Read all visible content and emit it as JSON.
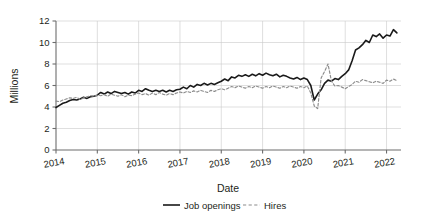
{
  "chart_data": {
    "type": "line",
    "title": "",
    "xlabel": "Date",
    "ylabel": "Millions",
    "xlim": [
      2014.0,
      2022.35
    ],
    "ylim": [
      0,
      12
    ],
    "yticks": [
      0,
      2,
      4,
      6,
      8,
      10,
      12
    ],
    "ytick_labels": [
      "0",
      "2",
      "4",
      "6",
      "8",
      "10",
      "12"
    ],
    "xticks": [
      2014,
      2015,
      2016,
      2017,
      2018,
      2019,
      2020,
      2021,
      2022
    ],
    "xtick_labels": [
      "2014",
      "2015",
      "2016",
      "2017",
      "2018",
      "2019",
      "2020",
      "2021",
      "2022"
    ],
    "grid": true,
    "grid_color": "#c9c9c9",
    "legend_position": "bottom",
    "legend": [
      {
        "name": "Job openings",
        "style": "solid",
        "color": "#1a1a1a"
      },
      {
        "name": "Hires",
        "style": "dashed",
        "color": "#8c8c8c"
      }
    ],
    "x": [
      2014.0,
      2014.083,
      2014.167,
      2014.25,
      2014.333,
      2014.417,
      2014.5,
      2014.583,
      2014.667,
      2014.75,
      2014.833,
      2014.917,
      2015.0,
      2015.083,
      2015.167,
      2015.25,
      2015.333,
      2015.417,
      2015.5,
      2015.583,
      2015.667,
      2015.75,
      2015.833,
      2015.917,
      2016.0,
      2016.083,
      2016.167,
      2016.25,
      2016.333,
      2016.417,
      2016.5,
      2016.583,
      2016.667,
      2016.75,
      2016.833,
      2016.917,
      2017.0,
      2017.083,
      2017.167,
      2017.25,
      2017.333,
      2017.417,
      2017.5,
      2017.583,
      2017.667,
      2017.75,
      2017.833,
      2017.917,
      2018.0,
      2018.083,
      2018.167,
      2018.25,
      2018.333,
      2018.417,
      2018.5,
      2018.583,
      2018.667,
      2018.75,
      2018.833,
      2018.917,
      2019.0,
      2019.083,
      2019.167,
      2019.25,
      2019.333,
      2019.417,
      2019.5,
      2019.583,
      2019.667,
      2019.75,
      2019.833,
      2019.917,
      2020.0,
      2020.083,
      2020.167,
      2020.25,
      2020.333,
      2020.417,
      2020.5,
      2020.583,
      2020.667,
      2020.75,
      2020.833,
      2020.917,
      2021.0,
      2021.083,
      2021.167,
      2021.25,
      2021.333,
      2021.417,
      2021.5,
      2021.583,
      2021.667,
      2021.75,
      2021.833,
      2021.917,
      2022.0,
      2022.083,
      2022.167,
      2022.25
    ],
    "series": [
      {
        "name": "Job openings",
        "style": "solid",
        "color": "#1a1a1a",
        "units": "millions",
        "values": [
          3.95,
          4.15,
          4.35,
          4.45,
          4.6,
          4.7,
          4.65,
          4.75,
          4.9,
          4.8,
          4.95,
          5.0,
          5.1,
          5.35,
          5.2,
          5.4,
          5.25,
          5.45,
          5.35,
          5.25,
          5.35,
          5.2,
          5.4,
          5.3,
          5.55,
          5.45,
          5.7,
          5.55,
          5.45,
          5.55,
          5.45,
          5.55,
          5.4,
          5.55,
          5.45,
          5.6,
          5.65,
          5.85,
          5.7,
          6.0,
          5.85,
          6.1,
          6.0,
          6.2,
          6.05,
          6.2,
          6.1,
          6.25,
          6.4,
          6.6,
          6.45,
          6.8,
          6.7,
          6.95,
          6.85,
          7.0,
          6.85,
          7.05,
          6.9,
          7.1,
          6.95,
          7.15,
          7.0,
          6.9,
          7.05,
          6.8,
          6.95,
          6.85,
          6.7,
          6.6,
          6.75,
          6.55,
          6.7,
          6.55,
          6.0,
          4.65,
          5.2,
          5.6,
          6.2,
          6.5,
          6.4,
          6.65,
          6.55,
          6.85,
          7.1,
          7.45,
          8.3,
          9.3,
          9.5,
          9.8,
          10.2,
          10.0,
          10.7,
          10.55,
          10.8,
          10.4,
          10.7,
          10.6,
          11.2,
          10.9
        ]
      },
      {
        "name": "Hires",
        "style": "dashed",
        "color": "#8c8c8c",
        "units": "millions",
        "values": [
          4.55,
          4.5,
          4.65,
          4.75,
          4.85,
          4.8,
          4.9,
          4.7,
          4.85,
          4.95,
          5.05,
          5.0,
          5.1,
          5.05,
          5.15,
          5.0,
          5.2,
          5.1,
          5.0,
          5.15,
          4.95,
          5.1,
          5.05,
          5.2,
          5.3,
          5.15,
          5.25,
          5.1,
          5.3,
          5.15,
          5.35,
          5.2,
          5.1,
          5.25,
          5.15,
          5.3,
          5.4,
          5.3,
          5.45,
          5.35,
          5.5,
          5.4,
          5.55,
          5.45,
          5.35,
          5.55,
          5.45,
          5.6,
          5.7,
          5.6,
          5.75,
          5.9,
          5.8,
          5.95,
          5.85,
          5.75,
          5.9,
          5.8,
          5.95,
          5.85,
          5.75,
          5.9,
          5.8,
          5.95,
          5.85,
          5.75,
          5.9,
          5.8,
          5.95,
          5.85,
          5.75,
          5.9,
          5.8,
          5.95,
          5.3,
          4.1,
          3.85,
          6.7,
          7.3,
          8.0,
          6.4,
          5.95,
          6.0,
          5.85,
          5.7,
          5.9,
          6.1,
          6.4,
          6.3,
          6.55,
          6.45,
          6.35,
          6.25,
          6.4,
          6.3,
          6.2,
          6.5,
          6.4,
          6.6,
          6.45
        ]
      }
    ]
  }
}
